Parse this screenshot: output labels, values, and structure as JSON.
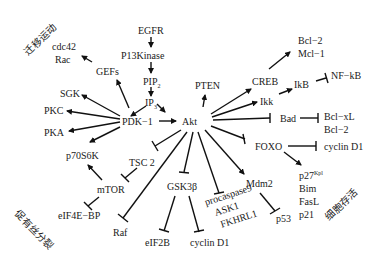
{
  "diagram": {
    "title": "",
    "regions": {
      "migration": "迁移运动",
      "mitosis": "促有丝分裂",
      "survival": "细胞存活"
    },
    "nodes": {
      "egfr": "EGFR",
      "pi3k": "P13Kinase",
      "pip2": "PIP",
      "pip2_sub": "2",
      "ip3": "IP",
      "ip3_sub": "3",
      "pten": "PTEN",
      "pdk1": "PDK−1",
      "akt": "Akt",
      "cdc42": "cdc42",
      "rac": "Rac",
      "gefs": "GEFs",
      "sgk": "SGK",
      "pkc": "PKC",
      "pka": "PKA",
      "p70s6k": "p70S6K",
      "tsc2": "TSC 2",
      "mtor": "mTOR",
      "eif4ebp": "eIF4E−BP",
      "raf": "Raf",
      "gsk3b": "GSK3β",
      "eif2b": "eIF2B",
      "cyclind1_a": "cyclin D1",
      "procaspase9": "procaspase9",
      "ask1": "ASK1",
      "fkhrl1": "FKHRL1",
      "mdm2": "Mdm2",
      "p53": "p53",
      "creb": "CREB",
      "bcl2_a": "Bcl−2",
      "mcl1": "Mcl−1",
      "ikb": "IkB",
      "nfkb": "NF−kB",
      "ikk": "Ikk",
      "bad": "Bad",
      "bclxl": "Bcl−xL",
      "bcl2_b": "Bcl−2",
      "foxo": "FOXO",
      "cyclind1_b": "cyclin D1",
      "p27": "p27",
      "p27_sup": "Kpl",
      "bim": "Bim",
      "fasl": "FasL",
      "p21": "p21"
    },
    "edges": [
      {
        "from": "EGFR",
        "to": "P13Kinase",
        "type": "activate"
      },
      {
        "from": "P13Kinase",
        "to": "PIP2",
        "type": "activate"
      },
      {
        "from": "PIP2",
        "to": "IP3",
        "type": "activate"
      },
      {
        "from": "IP3",
        "to": "PDK-1",
        "type": "activate"
      },
      {
        "from": "IP3",
        "to": "Akt",
        "type": "activate"
      },
      {
        "from": "PDK-1",
        "to": "Akt",
        "type": "activate"
      },
      {
        "from": "Akt",
        "to": "PTEN",
        "type": "activate"
      },
      {
        "from": "PDK-1",
        "to": "GEFs",
        "type": "activate"
      },
      {
        "from": "GEFs",
        "to": "cdc42/Rac",
        "type": "activate"
      },
      {
        "from": "PDK-1",
        "to": "SGK",
        "type": "activate"
      },
      {
        "from": "PDK-1",
        "to": "PKC",
        "type": "activate"
      },
      {
        "from": "PDK-1",
        "to": "PKA",
        "type": "activate"
      },
      {
        "from": "PDK-1",
        "to": "p70S6K",
        "type": "activate"
      },
      {
        "from": "mTOR",
        "to": "p70S6K",
        "type": "activate"
      },
      {
        "from": "Akt",
        "to": "TSC 2",
        "type": "inhibit"
      },
      {
        "from": "TSC 2",
        "to": "mTOR",
        "type": "inhibit"
      },
      {
        "from": "mTOR",
        "to": "eIF4E-BP",
        "type": "inhibit"
      },
      {
        "from": "Akt",
        "to": "Raf",
        "type": "inhibit"
      },
      {
        "from": "Akt",
        "to": "GSK3β",
        "type": "inhibit"
      },
      {
        "from": "GSK3β",
        "to": "eIF2B",
        "type": "inhibit"
      },
      {
        "from": "GSK3β",
        "to": "cyclin D1",
        "type": "inhibit"
      },
      {
        "from": "Akt",
        "to": "procaspase9/ASK1/FKHRL1",
        "type": "inhibit"
      },
      {
        "from": "Akt",
        "to": "Mdm2",
        "type": "activate"
      },
      {
        "from": "Mdm2",
        "to": "p53",
        "type": "inhibit"
      },
      {
        "from": "Akt",
        "to": "CREB",
        "type": "activate"
      },
      {
        "from": "CREB",
        "to": "Bcl-2/Mcl-1",
        "type": "activate"
      },
      {
        "from": "Akt",
        "to": "IkB",
        "type": "activate"
      },
      {
        "from": "IkB",
        "to": "NF-kB",
        "type": "inhibit"
      },
      {
        "from": "Akt",
        "to": "Ikk",
        "type": "activate"
      },
      {
        "from": "Akt",
        "to": "Bad",
        "type": "inhibit"
      },
      {
        "from": "Bad",
        "to": "Bcl-xL/Bcl-2",
        "type": "inhibit"
      },
      {
        "from": "Akt",
        "to": "FOXO",
        "type": "inhibit"
      },
      {
        "from": "FOXO",
        "to": "cyclin D1",
        "type": "inhibit"
      },
      {
        "from": "FOXO",
        "to": "p27/Bim/FasL/p21",
        "type": "activate"
      }
    ]
  }
}
